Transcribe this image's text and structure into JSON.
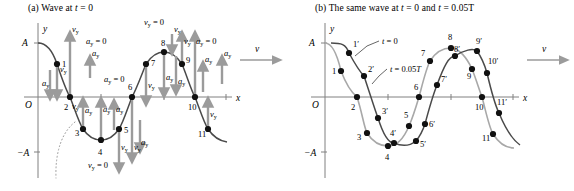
{
  "figure": {
    "width": 574,
    "height": 191,
    "background": "#ffffff",
    "colors": {
      "curve_dark": "#4a4a4a",
      "curve_light": "#a8a8a8",
      "axis": "#808080",
      "arrow": "#9b9b9b",
      "dot": "#111111",
      "text": "#000000",
      "leader": "#555555"
    }
  },
  "panel_a": {
    "caption_prefix": "(a)",
    "caption_text": "Wave at",
    "caption_var": "t",
    "caption_eq": "= 0",
    "axis": {
      "y_label": "y",
      "x_label": "x",
      "origin_label": "O",
      "amplitude_pos_label": "A",
      "amplitude_neg_label": "−A"
    },
    "wave_velocity_label": "v",
    "points": [
      {
        "id": "1",
        "label": "1",
        "x": 57,
        "y": 64
      },
      {
        "id": "2",
        "label": "2",
        "x": 70,
        "y": 97
      },
      {
        "id": "3",
        "label": "3",
        "x": 83,
        "y": 129
      },
      {
        "id": "4",
        "label": "4",
        "x": 101,
        "y": 140
      },
      {
        "id": "5",
        "label": "5",
        "x": 119,
        "y": 129
      },
      {
        "id": "6",
        "label": "6",
        "x": 132,
        "y": 97
      },
      {
        "id": "7",
        "label": "7",
        "x": 146,
        "y": 64
      },
      {
        "id": "8",
        "label": "8",
        "x": 164,
        "y": 52
      },
      {
        "id": "9",
        "label": "9",
        "x": 182,
        "y": 64
      },
      {
        "id": "10",
        "label": "10",
        "x": 195,
        "y": 97
      },
      {
        "id": "11",
        "label": "11",
        "x": 208,
        "y": 129
      }
    ],
    "annotations": [
      {
        "kind": "vy_zero",
        "text": "vy = 0",
        "at_point": "8",
        "position": "above"
      },
      {
        "kind": "vy_zero",
        "text": "vy = 0",
        "at_point": "4",
        "position": "below"
      },
      {
        "kind": "ay_zero",
        "text": "ay = 0",
        "at_point": "2",
        "position": "upper-right"
      },
      {
        "kind": "ay_zero",
        "text": "ay = 0",
        "at_point": "6",
        "position": "upper-left"
      },
      {
        "kind": "ay_zero",
        "text": "ay = 0",
        "at_point": "10",
        "position": "upper-right"
      }
    ],
    "vector_labels": {
      "velocity": "vy",
      "acceleration": "ay"
    }
  },
  "panel_b": {
    "caption_prefix": "(b)",
    "caption_text": "The same wave at",
    "caption_var1": "t",
    "caption_eq1": "= 0",
    "caption_and": "and",
    "caption_var2": "t",
    "caption_eq2": "= 0.05T",
    "axis": {
      "y_label": "y",
      "x_label": "x",
      "origin_label": "O",
      "amplitude_pos_label": "A",
      "amplitude_neg_label": "−A"
    },
    "wave_velocity_label": "v",
    "curve_labels": [
      {
        "id": "t0",
        "text": "t = 0",
        "x": 357,
        "y": 41
      },
      {
        "id": "t005T",
        "text": "t = 0.05T",
        "x": 361,
        "y": 69
      }
    ],
    "points_t0": [
      {
        "id": "1",
        "label": "1",
        "x": 54,
        "y": 71
      },
      {
        "id": "2",
        "label": "2",
        "x": 70,
        "y": 97
      },
      {
        "id": "3",
        "label": "3",
        "x": 80,
        "y": 133
      },
      {
        "id": "4",
        "label": "4",
        "x": 101,
        "y": 146
      },
      {
        "id": "5",
        "label": "5",
        "x": 122,
        "y": 126
      },
      {
        "id": "6",
        "label": "6",
        "x": 132,
        "y": 97
      },
      {
        "id": "7",
        "label": "7",
        "x": 143,
        "y": 61
      },
      {
        "id": "8",
        "label": "8",
        "x": 164,
        "y": 48
      },
      {
        "id": "9",
        "label": "9",
        "x": 185,
        "y": 69
      },
      {
        "id": "10",
        "label": "10",
        "x": 195,
        "y": 97
      },
      {
        "id": "11",
        "label": "11",
        "x": 206,
        "y": 134
      }
    ],
    "points_t005T": [
      {
        "id": "1p",
        "label": "1′",
        "x": 62,
        "y": 53
      },
      {
        "id": "2p",
        "label": "2′",
        "x": 77,
        "y": 76
      },
      {
        "id": "3p",
        "label": "3′",
        "x": 91,
        "y": 118
      },
      {
        "id": "4p",
        "label": "4′",
        "x": 107,
        "y": 143
      },
      {
        "id": "5p",
        "label": "5′",
        "x": 129,
        "y": 141
      },
      {
        "id": "6p",
        "label": "6′",
        "x": 138,
        "y": 124
      },
      {
        "id": "7p",
        "label": "7′",
        "x": 150,
        "y": 85
      },
      {
        "id": "8p",
        "label": "8′",
        "x": 168,
        "y": 56
      },
      {
        "id": "9p",
        "label": "9′",
        "x": 190,
        "y": 51
      },
      {
        "id": "10p",
        "label": "10′",
        "x": 200,
        "y": 73
      },
      {
        "id": "11p",
        "label": "11′",
        "x": 212,
        "y": 113
      }
    ]
  }
}
